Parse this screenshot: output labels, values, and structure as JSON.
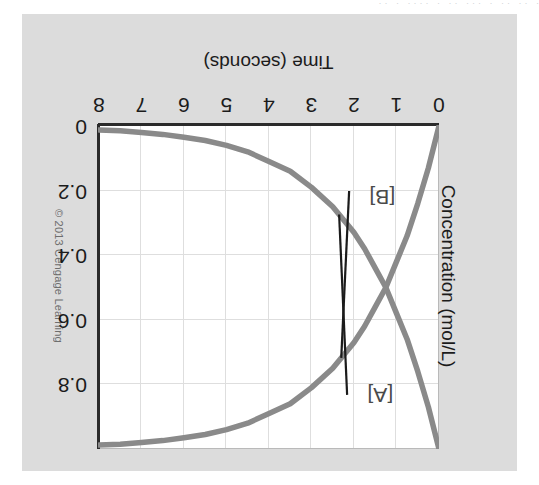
{
  "figure": {
    "copyright": "© 2013 Cengage Learning",
    "orientation_note": "180-degree-rotated",
    "top_bleed_text": "·   ·· ··  · ···   ·· ·  ····  · ··",
    "panel_color": "#dcdcdc",
    "plot_color": "#ffffff",
    "grid_color": "#dedede",
    "axis_color": "#2b2b2b",
    "curve_color": "#8a8a8a",
    "leader_color": "#1b1b1b"
  },
  "chart_data": {
    "type": "line",
    "title": "",
    "xlabel": "Time (seconds)",
    "ylabel": "Concentration (mol/L)",
    "xlim": [
      0,
      8
    ],
    "ylim": [
      0,
      1.0
    ],
    "xticks": [
      0,
      1,
      2,
      3,
      4,
      5,
      6,
      7,
      8
    ],
    "xticklabels": [
      "0",
      "1",
      "2",
      "3",
      "4",
      "5",
      "6",
      "7",
      "8"
    ],
    "yticks": [
      0,
      0.2,
      0.4,
      0.6,
      0.8
    ],
    "yticklabels": [
      "0",
      "0.2",
      "0.4",
      "0.6",
      "0.8"
    ],
    "grid": true,
    "legend": "inline-callouts",
    "annotations": [
      {
        "text": "[A]",
        "points_to_series": "[A]",
        "at_time": 1.55,
        "at_conc": 0.82
      },
      {
        "text": "[B]",
        "points_to_series": "[B]",
        "at_time": 1.55,
        "at_conc": 0.22
      }
    ],
    "x": [
      0,
      0.25,
      0.5,
      0.75,
      1,
      1.25,
      1.5,
      1.75,
      2,
      2.5,
      3,
      3.5,
      4,
      4.5,
      5,
      5.5,
      6,
      6.5,
      7,
      7.5,
      8
    ],
    "series": [
      {
        "name": "[A]",
        "values": [
          1.0,
          0.87,
          0.76,
          0.66,
          0.58,
          0.5,
          0.44,
          0.38,
          0.33,
          0.25,
          0.19,
          0.14,
          0.11,
          0.08,
          0.06,
          0.045,
          0.035,
          0.026,
          0.02,
          0.015,
          0.012
        ]
      },
      {
        "name": "[B]",
        "values": [
          0.0,
          0.13,
          0.24,
          0.34,
          0.42,
          0.5,
          0.56,
          0.62,
          0.67,
          0.75,
          0.81,
          0.86,
          0.89,
          0.92,
          0.94,
          0.955,
          0.965,
          0.974,
          0.98,
          0.985,
          0.988
        ]
      }
    ]
  }
}
